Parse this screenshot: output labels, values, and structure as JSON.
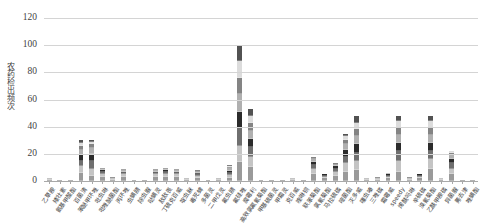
{
  "chart_data": {
    "type": "bar",
    "stacked": true,
    "title": "",
    "xlabel": "",
    "ylabel": "农药检出频次",
    "ylim": [
      0,
      120
    ],
    "yticks": [
      0,
      20,
      40,
      60,
      80,
      100,
      120
    ],
    "grid": true,
    "legend": "none",
    "colors": [
      "#9a9a9a",
      "#c4c4c4",
      "#6f6f6f",
      "#2b2b2b",
      "#b0b0b0",
      "#848484",
      "#dcdcdc",
      "#525252"
    ],
    "categories": [
      "乙草胺",
      "矮壮素",
      "氨基甲酸酯",
      "百菌清",
      "苯醚甲环唑",
      "吡虫啉",
      "吡唑醚菌酯",
      "丙环唑",
      "虫螨腈",
      "除虫脲",
      "哒螨灵",
      "敌敌畏",
      "丁硫克百威",
      "啶虫脒",
      "毒死蜱",
      "多菌灵",
      "二甲戊灵",
      "氟虫腈",
      "氟硅唑",
      "腐霉利",
      "高效氯氟氰菊酯",
      "甲基硫菌灵",
      "甲霜灵",
      "克百威",
      "喹啉铜",
      "联苯菊酯",
      "氯氰菊酯",
      "马拉硫磷",
      "嘧菌酯",
      "灭多威",
      "噻虫嗪",
      "三唑磷",
      "霜霉威",
      "speedy",
      "烯酰吗啉",
      "辛硫磷",
      "溴氰菊酯",
      "乙酰甲胺磷",
      "异菌脲",
      "莠去津",
      "唑螨酯"
    ],
    "values": [
      2,
      1,
      1,
      30,
      30,
      10,
      3,
      9,
      1,
      1,
      9,
      10,
      9,
      2,
      8,
      1,
      2,
      12,
      100,
      53,
      1,
      1,
      1,
      2,
      1,
      18,
      5,
      13,
      35,
      48,
      2,
      3,
      6,
      48,
      3,
      5,
      48,
      2,
      22,
      1,
      1
    ],
    "series": [
      {
        "name": "segment-1",
        "values": [
          1,
          1,
          1,
          6,
          4,
          3,
          1,
          3,
          1,
          1,
          3,
          3,
          3,
          1,
          2,
          1,
          1,
          3,
          14,
          10,
          1,
          1,
          1,
          1,
          1,
          5,
          2,
          4,
          7,
          8,
          1,
          1,
          2,
          7,
          1,
          2,
          9,
          1,
          5,
          1,
          1
        ]
      },
      {
        "name": "segment-2",
        "values": [
          1,
          0,
          0,
          5,
          5,
          2,
          1,
          2,
          0,
          0,
          2,
          2,
          2,
          1,
          2,
          0,
          1,
          2,
          12,
          8,
          0,
          0,
          0,
          1,
          0,
          4,
          1,
          3,
          6,
          7,
          1,
          1,
          1,
          8,
          1,
          1,
          7,
          1,
          4,
          0,
          0
        ]
      },
      {
        "name": "segment-3",
        "values": [
          0,
          0,
          0,
          4,
          6,
          2,
          1,
          1,
          0,
          0,
          1,
          2,
          1,
          0,
          1,
          0,
          0,
          2,
          13,
          7,
          0,
          0,
          0,
          0,
          0,
          3,
          1,
          2,
          5,
          6,
          0,
          1,
          1,
          7,
          1,
          1,
          6,
          0,
          4,
          0,
          0
        ]
      },
      {
        "name": "segment-4",
        "values": [
          0,
          0,
          0,
          4,
          5,
          1,
          0,
          1,
          0,
          0,
          1,
          1,
          1,
          0,
          1,
          0,
          0,
          2,
          12,
          6,
          0,
          0,
          0,
          0,
          0,
          2,
          1,
          2,
          5,
          6,
          0,
          0,
          1,
          6,
          0,
          1,
          6,
          0,
          3,
          0,
          0
        ]
      },
      {
        "name": "segment-5",
        "values": [
          0,
          0,
          0,
          4,
          4,
          1,
          0,
          1,
          0,
          0,
          1,
          1,
          1,
          0,
          1,
          0,
          0,
          2,
          13,
          6,
          0,
          0,
          0,
          0,
          0,
          2,
          0,
          1,
          4,
          6,
          0,
          0,
          1,
          6,
          0,
          0,
          6,
          0,
          3,
          0,
          0
        ]
      },
      {
        "name": "segment-6",
        "values": [
          0,
          0,
          0,
          3,
          3,
          1,
          0,
          1,
          0,
          0,
          1,
          1,
          1,
          0,
          1,
          0,
          0,
          1,
          12,
          6,
          0,
          0,
          0,
          0,
          0,
          2,
          0,
          1,
          3,
          5,
          0,
          0,
          0,
          5,
          0,
          0,
          5,
          0,
          2,
          0,
          0
        ]
      },
      {
        "name": "segment-7",
        "values": [
          0,
          0,
          0,
          2,
          2,
          0,
          0,
          0,
          0,
          0,
          0,
          0,
          0,
          0,
          0,
          0,
          0,
          1,
          12,
          5,
          0,
          0,
          0,
          0,
          0,
          0,
          0,
          0,
          3,
          5,
          0,
          0,
          0,
          5,
          0,
          0,
          5,
          0,
          1,
          0,
          0
        ]
      },
      {
        "name": "segment-8",
        "values": [
          0,
          0,
          0,
          2,
          1,
          0,
          0,
          0,
          0,
          0,
          0,
          0,
          0,
          0,
          0,
          0,
          0,
          1,
          12,
          5,
          0,
          0,
          0,
          0,
          0,
          0,
          0,
          0,
          2,
          5,
          0,
          0,
          0,
          4,
          0,
          0,
          4,
          0,
          0,
          0,
          0
        ]
      }
    ]
  }
}
